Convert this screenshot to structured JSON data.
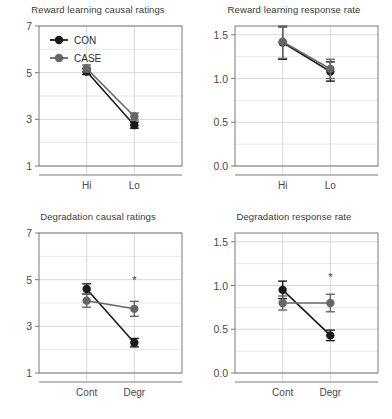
{
  "figure": {
    "layout": "2x2-panel-grid",
    "series_colors": {
      "CON": "#1a1a1a",
      "CASE": "#666666"
    },
    "legend": {
      "position": "top-left-panel-inside",
      "entries": [
        {
          "label": "CON",
          "marker": "filled-circle",
          "color": "#1a1a1a"
        },
        {
          "label": "CASE",
          "marker": "filled-circle",
          "color": "#666666"
        }
      ]
    }
  },
  "chart_data": [
    {
      "type": "line",
      "panel": "top-left",
      "title": "Reward learning causal ratings",
      "xlabel": "",
      "ylabel": "",
      "categories": [
        "Hi",
        "Lo"
      ],
      "ylim": [
        1,
        7
      ],
      "yticks": [
        1,
        3,
        5,
        7
      ],
      "ytick_labels": [
        "1",
        "3",
        "5",
        "7"
      ],
      "minor_gridlines": [
        2,
        4,
        6
      ],
      "grid": true,
      "legend": true,
      "annotations": [],
      "series": [
        {
          "name": "CON",
          "color": "#1a1a1a",
          "values": [
            5.05,
            2.75
          ],
          "err_low": [
            0.13,
            0.13
          ],
          "err_high": [
            0.13,
            0.13
          ]
        },
        {
          "name": "CASE",
          "color": "#666666",
          "values": [
            5.18,
            3.12
          ],
          "err_low": [
            0.15,
            0.15
          ],
          "err_high": [
            0.15,
            0.15
          ]
        }
      ]
    },
    {
      "type": "line",
      "panel": "top-right",
      "title": "Reward learning response rate",
      "xlabel": "",
      "ylabel": "",
      "categories": [
        "Hi",
        "Lo"
      ],
      "ylim": [
        0.0,
        1.6
      ],
      "yticks": [
        0.0,
        0.5,
        1.0,
        1.5
      ],
      "ytick_labels": [
        "0.0",
        "0.5",
        "1.0",
        "1.5"
      ],
      "minor_gridlines": [
        0.25,
        0.75,
        1.25
      ],
      "grid": true,
      "legend": false,
      "annotations": [],
      "series": [
        {
          "name": "CON",
          "color": "#1a1a1a",
          "values": [
            1.41,
            1.08
          ],
          "err_low": [
            0.19,
            0.11
          ],
          "err_high": [
            0.18,
            0.11
          ]
        },
        {
          "name": "CASE",
          "color": "#666666",
          "values": [
            1.42,
            1.11
          ],
          "err_low": [
            0.19,
            0.11
          ],
          "err_high": [
            0.18,
            0.11
          ]
        }
      ]
    },
    {
      "type": "line",
      "panel": "bottom-left",
      "title": "Degradation causal ratings",
      "xlabel": "",
      "ylabel": "",
      "categories": [
        "Cont",
        "Degr"
      ],
      "ylim": [
        1,
        7
      ],
      "yticks": [
        1,
        3,
        5,
        7
      ],
      "ytick_labels": [
        "1",
        "3",
        "5",
        "7"
      ],
      "minor_gridlines": [
        2,
        4,
        6
      ],
      "grid": true,
      "legend": false,
      "annotations": [
        {
          "text": "*",
          "x_category": "Degr",
          "y": 5.0
        }
      ],
      "series": [
        {
          "name": "CON",
          "color": "#1a1a1a",
          "values": [
            4.6,
            2.3
          ],
          "err_low": [
            0.22,
            0.18
          ],
          "err_high": [
            0.22,
            0.18
          ]
        },
        {
          "name": "CASE",
          "color": "#666666",
          "values": [
            4.1,
            3.75
          ],
          "err_low": [
            0.28,
            0.32
          ],
          "err_high": [
            0.28,
            0.32
          ]
        }
      ]
    },
    {
      "type": "line",
      "panel": "bottom-right",
      "title": "Degradation response rate",
      "xlabel": "",
      "ylabel": "",
      "categories": [
        "Cont",
        "Degr"
      ],
      "ylim": [
        0.0,
        1.6
      ],
      "yticks": [
        0.0,
        0.5,
        1.0,
        1.5
      ],
      "ytick_labels": [
        "0.0",
        "0.5",
        "1.0",
        "1.5"
      ],
      "minor_gridlines": [
        0.25,
        0.75,
        1.25
      ],
      "grid": true,
      "legend": false,
      "annotations": [
        {
          "text": "*",
          "x_category": "Degr",
          "y": 1.1
        }
      ],
      "series": [
        {
          "name": "CON",
          "color": "#1a1a1a",
          "values": [
            0.95,
            0.43
          ],
          "err_low": [
            0.1,
            0.06
          ],
          "err_high": [
            0.1,
            0.06
          ]
        },
        {
          "name": "CASE",
          "color": "#666666",
          "values": [
            0.8,
            0.8
          ],
          "err_low": [
            0.08,
            0.1
          ],
          "err_high": [
            0.08,
            0.1
          ]
        }
      ]
    }
  ]
}
